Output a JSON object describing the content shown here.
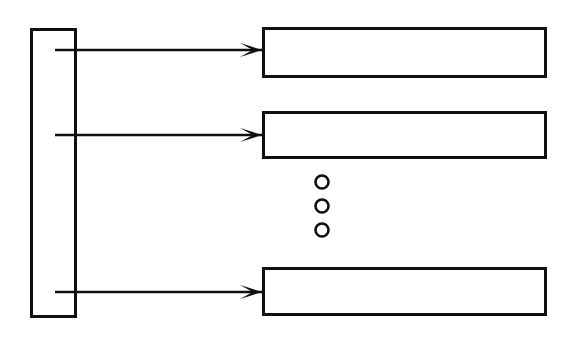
{
  "diagram": {
    "canvas": {
      "width": 574,
      "height": 346,
      "background": "#ffffff"
    },
    "style": {
      "stroke_color": "#101010",
      "fill_color": "none",
      "rect_stroke_width": 3,
      "line_stroke_width": 2.6,
      "dot_stroke_width": 2.6
    },
    "source_block": {
      "label": "",
      "x": 30,
      "y": 28,
      "width": 47,
      "height": 290
    },
    "target_blocks": [
      {
        "label": "",
        "x": 262,
        "y": 27,
        "width": 285,
        "height": 51
      },
      {
        "label": "",
        "x": 262,
        "y": 111,
        "width": 285,
        "height": 48
      },
      {
        "label": "",
        "x": 262,
        "y": 267,
        "width": 285,
        "height": 49
      }
    ],
    "connectors": [
      {
        "label": "",
        "x1": 55,
        "y1": 50,
        "x2": 262,
        "y2": 50
      },
      {
        "label": "",
        "x1": 55,
        "y1": 135,
        "x2": 262,
        "y2": 135
      },
      {
        "label": "",
        "x1": 55,
        "y1": 292,
        "x2": 262,
        "y2": 292
      }
    ],
    "arrow_heads": [
      {
        "tip_x": 262,
        "tip_y": 50,
        "length": 22,
        "half_height": 7
      },
      {
        "tip_x": 262,
        "tip_y": 135,
        "length": 22,
        "half_height": 7
      },
      {
        "tip_x": 262,
        "tip_y": 292,
        "length": 22,
        "half_height": 7
      }
    ],
    "vertical_ellipsis": {
      "label": "continuation-ellipsis",
      "cx": 322,
      "dots": [
        {
          "cy": 182,
          "r": 6.5
        },
        {
          "cy": 206,
          "r": 6.5
        },
        {
          "cy": 230,
          "r": 6.5
        }
      ]
    }
  }
}
